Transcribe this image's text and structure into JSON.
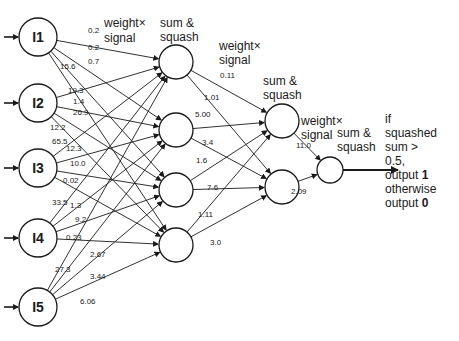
{
  "diagram": {
    "input_nodes": [
      {
        "id": "I1",
        "label": "I1",
        "cx": 38,
        "cy": 37
      },
      {
        "id": "I2",
        "label": "I2",
        "cx": 38,
        "cy": 103
      },
      {
        "id": "I3",
        "label": "I3",
        "cx": 38,
        "cy": 168
      },
      {
        "id": "I4",
        "label": "I4",
        "cx": 38,
        "cy": 238
      },
      {
        "id": "I5",
        "label": "I5",
        "cx": 38,
        "cy": 307
      }
    ],
    "hidden1_nodes": [
      {
        "id": "H1",
        "cx": 176,
        "cy": 62
      },
      {
        "id": "H2",
        "cx": 176,
        "cy": 130
      },
      {
        "id": "H3",
        "cx": 176,
        "cy": 190
      },
      {
        "id": "H4",
        "cx": 176,
        "cy": 245
      }
    ],
    "hidden2_nodes": [
      {
        "id": "J1",
        "cx": 282,
        "cy": 121
      },
      {
        "id": "J2",
        "cx": 282,
        "cy": 187
      }
    ],
    "output_node": {
      "id": "O",
      "cx": 330,
      "cy": 170
    },
    "edges_input_hidden1": [
      {
        "from": "I1",
        "to": "H1",
        "weight": "0.2",
        "lx": 88,
        "ly": 33
      },
      {
        "from": "I1",
        "to": "H2",
        "weight": "0.2",
        "lx": 88,
        "ly": 50
      },
      {
        "from": "I1",
        "to": "H3",
        "weight": "0.7",
        "lx": 88,
        "ly": 64
      },
      {
        "from": "I1",
        "to": "H4",
        "weight": "15.6",
        "lx": 60,
        "ly": 69
      },
      {
        "from": "I2",
        "to": "H1",
        "weight": "19.3",
        "lx": 68,
        "ly": 93
      },
      {
        "from": "I2",
        "to": "H2",
        "weight": "1.4",
        "lx": 73,
        "ly": 104
      },
      {
        "from": "I2",
        "to": "H3",
        "weight": "26.9",
        "lx": 73,
        "ly": 115
      },
      {
        "from": "I2",
        "to": "H4",
        "weight": "12.2",
        "lx": 50,
        "ly": 130
      },
      {
        "from": "I3",
        "to": "H1",
        "weight": "65.5",
        "lx": 52,
        "ly": 144
      },
      {
        "from": "I3",
        "to": "H2",
        "weight": "12.3",
        "lx": 66,
        "ly": 151
      },
      {
        "from": "I3",
        "to": "H3",
        "weight": "10.0",
        "lx": 70,
        "ly": 166
      },
      {
        "from": "I3",
        "to": "H4",
        "weight": "0.02",
        "lx": 63,
        "ly": 183
      },
      {
        "from": "I4",
        "to": "H1",
        "weight": "33.5",
        "lx": 52,
        "ly": 205
      },
      {
        "from": "I4",
        "to": "H2",
        "weight": "1.3",
        "lx": 70,
        "ly": 208
      },
      {
        "from": "I4",
        "to": "H3",
        "weight": "9.2",
        "lx": 75,
        "ly": 222
      },
      {
        "from": "I4",
        "to": "H4",
        "weight": "0.23",
        "lx": 66,
        "ly": 240
      },
      {
        "from": "I5",
        "to": "H1",
        "weight": "27.3",
        "lx": 55,
        "ly": 272
      },
      {
        "from": "I5",
        "to": "H2",
        "weight": "2.67",
        "lx": 90,
        "ly": 257
      },
      {
        "from": "I5",
        "to": "H3",
        "weight": "3.44",
        "lx": 90,
        "ly": 279
      },
      {
        "from": "I5",
        "to": "H4",
        "weight": "6.06",
        "lx": 80,
        "ly": 304
      }
    ],
    "edges_hidden1_hidden2": [
      {
        "from": "H1",
        "to": "J1",
        "weight": "0.11",
        "lx": 220,
        "ly": 78
      },
      {
        "from": "H1",
        "to": "J2",
        "weight": "1.01",
        "lx": 204,
        "ly": 100
      },
      {
        "from": "H2",
        "to": "J1",
        "weight": "5.00",
        "lx": 195,
        "ly": 117
      },
      {
        "from": "H2",
        "to": "J2",
        "weight": "3.4",
        "lx": 202,
        "ly": 145
      },
      {
        "from": "H3",
        "to": "J1",
        "weight": "1.6",
        "lx": 196,
        "ly": 163
      },
      {
        "from": "H3",
        "to": "J2",
        "weight": "7.6",
        "lx": 207,
        "ly": 190
      },
      {
        "from": "H4",
        "to": "J1",
        "weight": "1.11",
        "lx": 198,
        "ly": 217
      },
      {
        "from": "H4",
        "to": "J2",
        "weight": "3.0",
        "lx": 210,
        "ly": 245
      }
    ],
    "edges_hidden2_output": [
      {
        "from": "J1",
        "to": "O",
        "weight": "11.0",
        "lx": 296,
        "ly": 148
      },
      {
        "from": "J2",
        "to": "O",
        "weight": "2.09",
        "lx": 291,
        "ly": 194
      }
    ],
    "annotations": {
      "weight_signal_1": [
        "weight×",
        "signal"
      ],
      "sum_squash_1": [
        "sum &",
        "squash"
      ],
      "weight_signal_2": [
        "weight×",
        "signal"
      ],
      "sum_squash_2": [
        "sum &",
        "squash"
      ],
      "weight_signal_3": [
        "weight×",
        "signal"
      ],
      "sum_squash_3": [
        "sum &",
        "squash"
      ],
      "output_rule": [
        "if",
        "squashed",
        "sum >",
        "0.5,",
        "output 1",
        "otherwise",
        "output 0"
      ]
    },
    "colors": {
      "stroke": "#1a1a1a",
      "text": "#1a1a1a",
      "background": "#ffffff"
    }
  }
}
